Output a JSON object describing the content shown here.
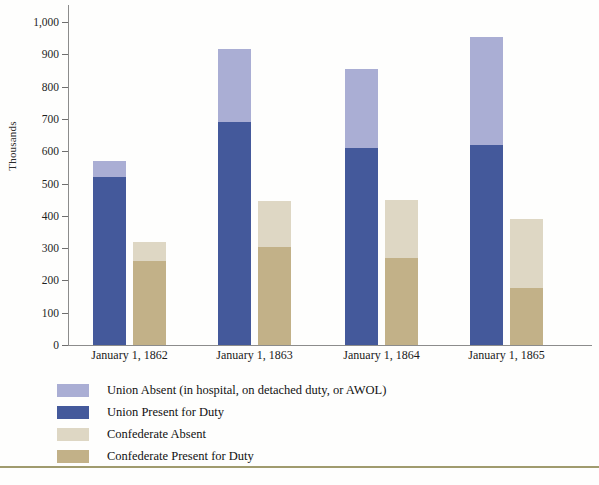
{
  "chart_data": {
    "type": "bar",
    "title": "",
    "subtitle": "",
    "xlabel": "",
    "ylabel": "Thousands",
    "categories": [
      "January 1, 1862",
      "January 1, 1863",
      "January 1, 1864",
      "January 1, 1865"
    ],
    "ylim": [
      0,
      1000
    ],
    "ytick_values": [
      0,
      100,
      200,
      300,
      400,
      500,
      600,
      700,
      800,
      900,
      1000
    ],
    "ytick_labels": [
      "0",
      "100",
      "200",
      "300",
      "400",
      "500",
      "600",
      "700",
      "800",
      "900",
      "1,000"
    ],
    "grid": false,
    "legend_position": "below-left",
    "stacked": true,
    "grouped": true,
    "groups": [
      {
        "name": "Union",
        "series": [
          {
            "name": "Union Present for Duty",
            "color": "#44599b",
            "values": [
              520,
              690,
              610,
              620
            ]
          },
          {
            "name": "Union Absent (in hospital, on detached duty, or AWOL)",
            "color": "#aaaed4",
            "values": [
              50,
              225,
              245,
              335
            ]
          }
        ],
        "totals": [
          570,
          915,
          855,
          955
        ]
      },
      {
        "name": "Confederate",
        "series": [
          {
            "name": "Confederate Present for Duty",
            "color": "#c2b188",
            "values": [
              260,
              305,
              270,
              175
            ]
          },
          {
            "name": "Confederate Absent",
            "color": "#ded7c4",
            "values": [
              60,
              140,
              180,
              215
            ]
          }
        ],
        "totals": [
          320,
          445,
          450,
          390
        ]
      }
    ],
    "legend": [
      {
        "label": "Union Absent (in hospital, on detached duty, or AWOL)",
        "color": "#aaaed4"
      },
      {
        "label": "Union Present for Duty",
        "color": "#44599b"
      },
      {
        "label": "Confederate Absent",
        "color": "#ded7c4"
      },
      {
        "label": "Confederate Present for Duty",
        "color": "#c2b188"
      }
    ]
  },
  "page": {
    "footer_ghost": ""
  }
}
